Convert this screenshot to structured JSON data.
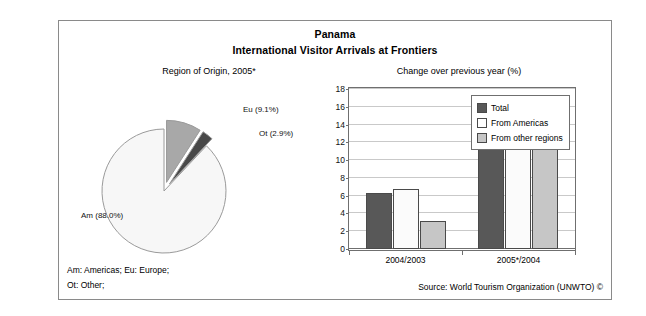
{
  "header": {
    "title": "Panama",
    "subtitle": "International Visitor Arrivals at Frontiers"
  },
  "pie_panel": {
    "caption": "Region of Origin, 2005*"
  },
  "bar_panel": {
    "caption": "Change over previous year (%)"
  },
  "footnotes": {
    "line1": "Am: Americas; Eu: Europe;",
    "line2": "Ot: Other;",
    "source": "Source: World Tourism Organization (UNWTO) ©"
  },
  "colors": {
    "series_total": "#585858",
    "series_americas": "#fbfbfb",
    "series_other": "#c6c6c6",
    "pie_am": "#f7f7f7",
    "pie_eu": "#a8a8a8",
    "pie_ot": "#484848",
    "frame": "#8a8a8a",
    "grid": "#c9c9c9"
  },
  "chart_data": [
    {
      "type": "pie",
      "title": "Region of Origin, 2005*",
      "labels": [
        "Am (88.0%)",
        "Eu (9.1%)",
        "Ot (2.9%)"
      ],
      "categories": [
        "Am",
        "Eu",
        "Ot"
      ],
      "values": [
        88.0,
        9.1,
        2.9
      ],
      "unit": "%",
      "exploded": [
        "Eu",
        "Ot"
      ],
      "legend": "none",
      "slice_colors": [
        "#f7f7f7",
        "#a8a8a8",
        "#484848"
      ]
    },
    {
      "type": "bar",
      "title": "Change over previous year (%)",
      "xlabel": "",
      "ylabel": "",
      "categories": [
        "2004/2003",
        "2005*/2004"
      ],
      "series": [
        {
          "name": "Total",
          "values": [
            6.3,
            15.5
          ]
        },
        {
          "name": "From Americas",
          "values": [
            6.8,
            15.5
          ]
        },
        {
          "name": "From other regions",
          "values": [
            3.1,
            15.6
          ]
        }
      ],
      "ylim": [
        0,
        18
      ],
      "yticks": [
        0,
        2,
        4,
        6,
        8,
        10,
        12,
        14,
        16,
        18
      ],
      "ytick_labels": [
        "0",
        "2",
        "4",
        "6",
        "8",
        "10",
        "12",
        "14",
        "16",
        "18"
      ],
      "grid": true,
      "legend_position": "top-right"
    }
  ]
}
